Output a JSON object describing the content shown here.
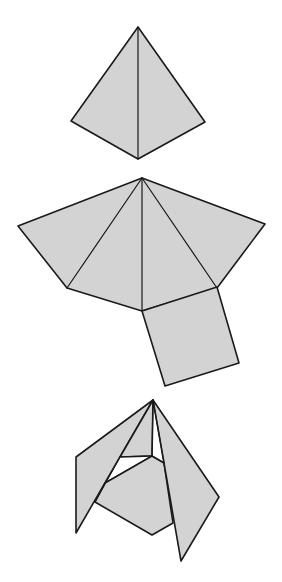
{
  "figure": {
    "colors": {
      "fill": "#d3d3d3",
      "stroke": "#1a1a1a",
      "background": "#ffffff"
    },
    "panels": [
      {
        "id": "pyramid",
        "label": "Assembled square pyramid"
      },
      {
        "id": "net",
        "label": "Unfolded net: four triangles and a square base"
      },
      {
        "id": "folding",
        "label": "Net partially folded"
      }
    ],
    "caption_truncated": ""
  }
}
